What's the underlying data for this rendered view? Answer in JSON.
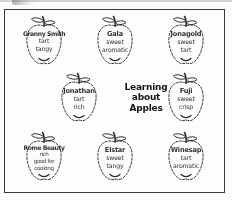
{
  "document": {
    "title": "Learning about Apples",
    "center_title_lines": [
      "Learning",
      "about",
      "Apples"
    ],
    "border_color": "#3c3a38",
    "ink_color": "#34322f",
    "page_color": "#fefefe"
  },
  "apples": [
    {
      "variety": "Granny Smith",
      "traits": [
        "tart",
        "tangy"
      ],
      "position": "top-left"
    },
    {
      "variety": "Gala",
      "traits": [
        "sweet",
        "aromatic"
      ],
      "position": "top-center"
    },
    {
      "variety": "Jonagold",
      "traits": [
        "sweet",
        "tart"
      ],
      "position": "top-right"
    },
    {
      "variety": "Jonathan",
      "traits": [
        "tart",
        "rich"
      ],
      "position": "middle-left"
    },
    {
      "variety": "Fuji",
      "traits": [
        "sweet",
        "crisp"
      ],
      "position": "middle-right"
    },
    {
      "variety": "Rome Beauty",
      "traits": [
        "rich",
        "good for",
        "cooking"
      ],
      "position": "bottom-left"
    },
    {
      "variety": "Elstar",
      "traits": [
        "sweet",
        "tangy"
      ],
      "position": "bottom-center"
    },
    {
      "variety": "Winesap",
      "traits": [
        "tart",
        "aromatic"
      ],
      "position": "bottom-right"
    }
  ]
}
